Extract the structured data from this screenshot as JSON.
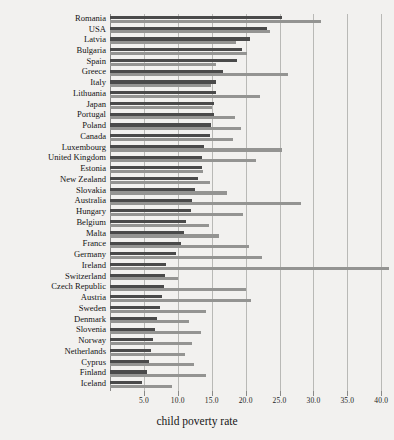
{
  "chart_data": {
    "type": "bar",
    "orientation": "horizontal",
    "title": "",
    "xlabel": "child poverty rate",
    "ylabel": "",
    "xlim": [
      0,
      40.7
    ],
    "grid": true,
    "legend_position": "none",
    "xticks": [
      "5.0",
      "10.0",
      "15.0",
      "20.0",
      "25.0",
      "30.0",
      "35.0",
      "40.0"
    ],
    "xtick_values": [
      5,
      10,
      15,
      20,
      25,
      30,
      35,
      40
    ],
    "categories": [
      "Romania",
      "USA",
      "Latvia",
      "Bulgaria",
      "Spain",
      "Greece",
      "Italy",
      "Lithuania",
      "Japan",
      "Portugal",
      "Poland",
      "Canada",
      "Luxembourg",
      "United Kingdom",
      "Estonia",
      "New Zealand",
      "Slovakia",
      "Australia",
      "Hungary",
      "Belgium",
      "Malta",
      "France",
      "Germany",
      "Ireland",
      "Switzerland",
      "Czech Republic",
      "Austria",
      "Sweden",
      "Denmark",
      "Slovenia",
      "Norway",
      "Netherlands",
      "Cyprus",
      "Finland",
      "Iceland"
    ],
    "series": [
      {
        "name": "dark-series",
        "color": "#4a4a4a",
        "values": [
          25.3,
          23.1,
          20.6,
          19.4,
          18.8,
          16.7,
          15.7,
          15.6,
          15.4,
          15.3,
          14.9,
          14.8,
          13.9,
          13.6,
          13.5,
          13.0,
          12.5,
          12.1,
          11.9,
          11.2,
          10.9,
          10.4,
          9.8,
          8.3,
          8.1,
          7.9,
          7.6,
          7.3,
          6.9,
          6.7,
          6.3,
          6.1,
          5.7,
          5.4,
          4.7
        ]
      },
      {
        "name": "light-series",
        "color": "#949492",
        "values": [
          31.1,
          23.6,
          18.6,
          20.2,
          15.6,
          26.3,
          14.9,
          22.1,
          15.0,
          18.5,
          19.3,
          18.2,
          25.4,
          21.6,
          13.7,
          14.7,
          17.3,
          28.1,
          19.6,
          14.6,
          16.1,
          20.5,
          22.4,
          41.2,
          10.0,
          20.0,
          20.8,
          14.1,
          11.6,
          13.4,
          12.1,
          11.0,
          12.4,
          14.2,
          9.2
        ]
      }
    ]
  }
}
